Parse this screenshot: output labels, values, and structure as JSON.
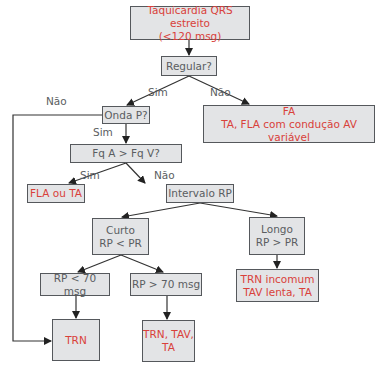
{
  "nodes": {
    "start": {
      "line1": "Taquicardia QRS estreito",
      "line2": "(<120 msg)"
    },
    "regular": {
      "text": "Regular?"
    },
    "fa": {
      "line1": "FA",
      "line2": "TA, FLA com condução AV variável"
    },
    "onda_p": {
      "text": "Onda P?"
    },
    "fq": {
      "text": "Fq A > Fq V?"
    },
    "fla_ta": {
      "text": "FLA ou TA"
    },
    "intervalo": {
      "text": "Intervalo RP"
    },
    "curto": {
      "line1": "Curto",
      "line2": "RP < PR"
    },
    "longo": {
      "line1": "Longo",
      "line2": "RP > PR"
    },
    "rp_lt70": {
      "text": "RP < 70 msg"
    },
    "rp_gt70": {
      "text": "RP > 70 msg"
    },
    "trn": {
      "text": "TRN"
    },
    "trn_tav_ta": {
      "line1": "TRN, TAV,",
      "line2": "TA"
    },
    "trn_incomum": {
      "line1": "TRN incomum",
      "line2": "TAV lenta, TA"
    }
  },
  "edge_labels": {
    "regular_sim": "Sim",
    "regular_nao": "Não",
    "onda_nao": "Não",
    "onda_sim": "Sim",
    "fq_sim": "Sim",
    "fq_nao": "Não"
  },
  "colors": {
    "box_fill": "#e3e4e6",
    "box_border": "#55585c",
    "question_text": "#5a5d61",
    "outcome_text": "#d9413a"
  }
}
